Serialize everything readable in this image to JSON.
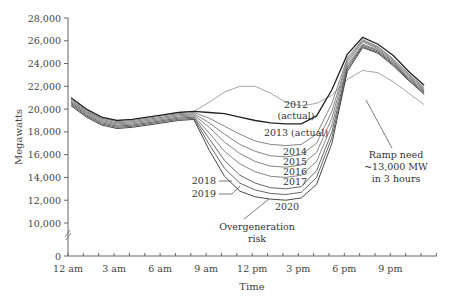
{
  "chart_data": {
    "type": "line",
    "title": "",
    "xlabel": "Time",
    "ylabel": "Megawatts",
    "xlim": [
      0,
      24
    ],
    "ylim": [
      0,
      28000
    ],
    "axis_break": "between 0 and 10,000",
    "grid": false,
    "y_ticks": [
      "0",
      "10,000",
      "12,000",
      "14,000",
      "16,000",
      "18,000",
      "20,000",
      "22,000",
      "24,000",
      "26,000",
      "28,000"
    ],
    "x_ticks": [
      "12 am",
      "3 am",
      "6 am",
      "9 am",
      "12 pm",
      "3 pm",
      "6 pm",
      "9 pm"
    ],
    "x_hours": [
      0,
      1,
      2,
      3,
      4,
      5,
      6,
      7,
      8,
      9,
      10,
      11,
      12,
      13,
      14,
      15,
      16,
      17,
      18,
      19,
      20,
      21,
      22,
      23
    ],
    "series": [
      {
        "name": "2012 (actual)",
        "color": "#9a9a9a",
        "values": [
          20600,
          19700,
          19200,
          19000,
          19100,
          19300,
          19500,
          19700,
          19800,
          20600,
          21500,
          22000,
          22000,
          21400,
          20600,
          20300,
          20500,
          21200,
          22600,
          23400,
          23200,
          22400,
          21400,
          20400
        ]
      },
      {
        "name": "2013 (actual)",
        "color": "#222222",
        "values": [
          21000,
          20000,
          19300,
          19000,
          19100,
          19300,
          19500,
          19700,
          19800,
          19700,
          19600,
          19300,
          19000,
          18800,
          18700,
          18700,
          19400,
          21700,
          24800,
          26300,
          25700,
          24700,
          23300,
          22100
        ]
      },
      {
        "name": "2014",
        "color": "#777777",
        "values": [
          20900,
          19900,
          19200,
          18900,
          19000,
          19200,
          19400,
          19600,
          19700,
          19200,
          18500,
          17800,
          17200,
          16900,
          16800,
          16900,
          17800,
          20500,
          24500,
          26100,
          25500,
          24400,
          23100,
          21900
        ]
      },
      {
        "name": "2015",
        "color": "#777777",
        "values": [
          20800,
          19800,
          19100,
          18800,
          18900,
          19100,
          19300,
          19500,
          19600,
          18800,
          17800,
          16900,
          16300,
          15900,
          15800,
          16000,
          17000,
          19800,
          24300,
          26000,
          25400,
          24300,
          23000,
          21800
        ]
      },
      {
        "name": "2016",
        "color": "#777777",
        "values": [
          20700,
          19700,
          19000,
          18700,
          18800,
          19000,
          19200,
          19400,
          19500,
          18400,
          17100,
          16100,
          15400,
          15000,
          14900,
          15100,
          16200,
          19200,
          24100,
          25900,
          25300,
          24200,
          22900,
          21700
        ]
      },
      {
        "name": "2017",
        "color": "#777777",
        "values": [
          20600,
          19600,
          18900,
          18600,
          18700,
          18900,
          19100,
          19300,
          19400,
          17900,
          16300,
          15200,
          14500,
          14100,
          14000,
          14200,
          15400,
          18600,
          23900,
          25700,
          25200,
          24100,
          22800,
          21600
        ]
      },
      {
        "name": "2018",
        "color": "#555555",
        "values": [
          20500,
          19500,
          18800,
          18500,
          18600,
          18800,
          19000,
          19200,
          19300,
          17400,
          15500,
          14200,
          13500,
          13100,
          13000,
          13200,
          14600,
          18000,
          23700,
          25600,
          25100,
          24000,
          22700,
          21500
        ]
      },
      {
        "name": "2019",
        "color": "#555555",
        "values": [
          20400,
          19400,
          18700,
          18400,
          18500,
          18700,
          18900,
          19100,
          19200,
          16900,
          14800,
          13500,
          12900,
          12600,
          12500,
          12700,
          14000,
          17500,
          23500,
          25500,
          25000,
          23900,
          22600,
          21400
        ]
      },
      {
        "name": "2020",
        "color": "#333333",
        "values": [
          20300,
          19300,
          18600,
          18300,
          18400,
          18600,
          18800,
          19000,
          19100,
          16400,
          14100,
          12800,
          12300,
          12100,
          12000,
          12200,
          13400,
          17000,
          23300,
          25400,
          24900,
          23800,
          22500,
          21300
        ]
      }
    ],
    "annotations": [
      {
        "text": "Overgeneration risk",
        "points_to": "2020 midday minimum"
      },
      {
        "text": "Ramp need ~13,000 MW in 3 hours",
        "points_to": "evening ramp ~6-7 pm"
      }
    ]
  },
  "labels": {
    "y_axis_title": "Megawatts",
    "x_axis_title": "Time",
    "label_2012_line1": "2012",
    "label_2012_line2": "(actual)",
    "label_2013": "2013 (actual)",
    "label_2014": "2014",
    "label_2015": "2015",
    "label_2016": "2016",
    "label_2017": "2017",
    "label_2018": "2018",
    "label_2019": "2019",
    "label_2020": "2020",
    "overgen_line1": "Overgeneration",
    "overgen_line2": "risk",
    "ramp_line1": "Ramp need",
    "ramp_line2": "~13,000 MW",
    "ramp_line3": "in 3 hours"
  }
}
